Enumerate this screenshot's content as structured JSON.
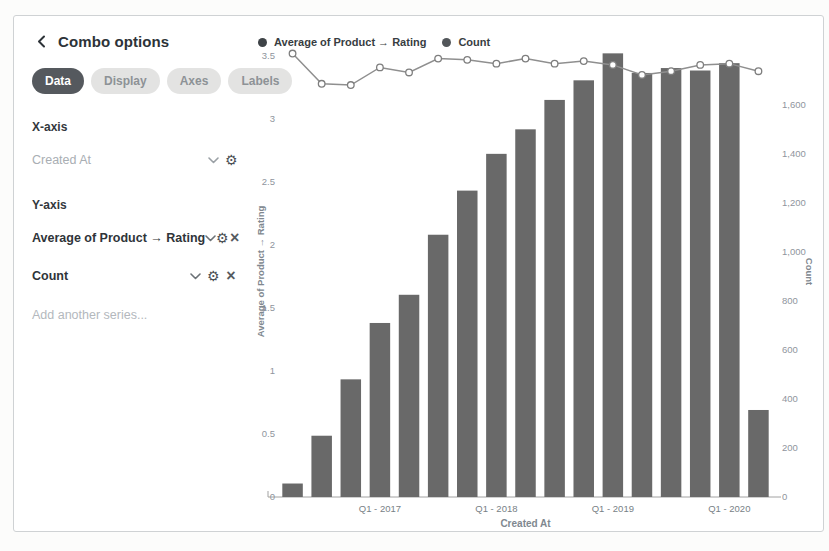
{
  "sidebar": {
    "title": "Combo options",
    "tabs": [
      {
        "label": "Data",
        "active": true
      },
      {
        "label": "Display",
        "active": false
      },
      {
        "label": "Axes",
        "active": false
      },
      {
        "label": "Labels",
        "active": false
      }
    ],
    "x_axis": {
      "label": "X-axis",
      "field": "Created At"
    },
    "y_axis": {
      "label": "Y-axis",
      "series": [
        {
          "name": "Average of Product → Rating"
        },
        {
          "name": "Count"
        }
      ]
    },
    "add_series": "Add another series..."
  },
  "chart_data": {
    "type": "combo",
    "categories": [
      "Q2 2016",
      "Q3 2016",
      "Q4 2016",
      "Q1 2017",
      "Q2 2017",
      "Q3 2017",
      "Q4 2017",
      "Q1 2018",
      "Q2 2018",
      "Q3 2018",
      "Q4 2018",
      "Q1 2019",
      "Q2 2019",
      "Q3 2019",
      "Q4 2019",
      "Q1 2020",
      "Q2 2020"
    ],
    "series": [
      {
        "name": "Average of Product → Rating",
        "type": "line",
        "axis": "left",
        "values": [
          3.52,
          3.28,
          3.27,
          3.41,
          3.37,
          3.48,
          3.47,
          3.44,
          3.48,
          3.44,
          3.46,
          3.43,
          3.35,
          3.38,
          3.43,
          3.44,
          3.38
        ]
      },
      {
        "name": "Count",
        "type": "bar",
        "axis": "right",
        "values": [
          55,
          250,
          480,
          710,
          825,
          1070,
          1250,
          1400,
          1500,
          1620,
          1700,
          1810,
          1730,
          1750,
          1740,
          1770,
          355
        ]
      }
    ],
    "xlabel": "Created At",
    "x_tick_labels": [
      {
        "index": 3,
        "label": "Q1 - 2017"
      },
      {
        "index": 7,
        "label": "Q1 - 2018"
      },
      {
        "index": 11,
        "label": "Q1 - 2019"
      },
      {
        "index": 15,
        "label": "Q1 - 2020"
      }
    ],
    "left_axis": {
      "label": "Average of Product → Rating",
      "max": 3.58,
      "ticks": [
        {
          "value": 0,
          "label": "0"
        },
        {
          "value": 0.5,
          "label": "0.5"
        },
        {
          "value": 1,
          "label": "1"
        },
        {
          "value": 1.5,
          "label": "1.5"
        },
        {
          "value": 2,
          "label": "2"
        },
        {
          "value": 2.5,
          "label": "2.5"
        },
        {
          "value": 3,
          "label": "3"
        },
        {
          "value": 3.5,
          "label": "3.5"
        }
      ]
    },
    "right_axis": {
      "label": "Count",
      "max": 1840,
      "ticks": [
        {
          "value": 0,
          "label": "0"
        },
        {
          "value": 200,
          "label": "200"
        },
        {
          "value": 400,
          "label": "400"
        },
        {
          "value": 600,
          "label": "600"
        },
        {
          "value": 800,
          "label": "800"
        },
        {
          "value": 1000,
          "label": "1,000"
        },
        {
          "value": 1200,
          "label": "1,200"
        },
        {
          "value": 1400,
          "label": "1,400"
        },
        {
          "value": 1600,
          "label": "1,600"
        }
      ]
    },
    "legend": [
      {
        "label": "Average of Product → Rating",
        "color": "#3e4347"
      },
      {
        "label": "Count",
        "color": "#52565a"
      }
    ],
    "grid": false,
    "colors": {
      "bar": "#696969",
      "line": "#8f8f8f",
      "marker_fill": "#ffffff",
      "marker_stroke": "#7e7e7e",
      "tick_text": "#8f959d",
      "x_tick_text": "#787f86",
      "axis_title": "#80888f",
      "axis_line": "#a2a2a2"
    }
  }
}
